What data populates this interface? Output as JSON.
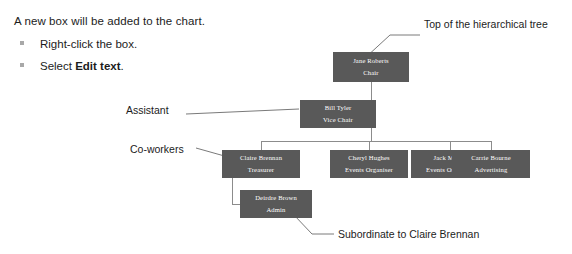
{
  "instructions": {
    "intro": "A new box will be added to the chart.",
    "bullets": [
      {
        "text_before": "Right-click the box.",
        "bold": "",
        "text_after": ""
      },
      {
        "text_before": "Select ",
        "bold": "Edit text",
        "text_after": "."
      }
    ]
  },
  "chart": {
    "type": "org-chart",
    "box_fill_color": "#595959",
    "box_text_color": "#ffffff",
    "connector_color": "#8c8c8c",
    "nodes": [
      {
        "id": "chair",
        "name": "Jane Roberts",
        "role": "Chair",
        "level": 0,
        "x": 333,
        "y": 52,
        "w": 76,
        "h": 30
      },
      {
        "id": "vice-chair",
        "name": "Bill Tyler",
        "role": "Vice Chair",
        "level": 1,
        "x": 300,
        "y": 100,
        "w": 76,
        "h": 28
      },
      {
        "id": "treasurer",
        "name": "Claire Brennan",
        "role": "Treasurer",
        "level": 2,
        "x": 222,
        "y": 150,
        "w": 78,
        "h": 28
      },
      {
        "id": "events-1",
        "name": "Cheryl Hughes",
        "role": "Events Organiser",
        "level": 2,
        "x": 330,
        "y": 150,
        "w": 78,
        "h": 28
      },
      {
        "id": "events-2",
        "name": "Jack Mason",
        "role": "Events Organiser",
        "level": 2,
        "x": 411,
        "y": 150,
        "w": 78,
        "h": 28
      },
      {
        "id": "advertising",
        "name": "Carrie Bourne",
        "role": "Advertising",
        "level": 2,
        "x": 452,
        "y": 150,
        "w": 78,
        "h": 28
      },
      {
        "id": "admin",
        "name": "Deirdre Brown",
        "role": "Admin",
        "level": 3,
        "x": 240,
        "y": 190,
        "w": 72,
        "h": 28
      }
    ],
    "callouts": [
      {
        "id": "top-of-tree",
        "label": "Top of the hierarchical tree",
        "x": 424,
        "y": 18,
        "target": "chair"
      },
      {
        "id": "assistant",
        "label": "Assistant",
        "x": 126,
        "y": 104,
        "target": "vice-chair"
      },
      {
        "id": "co-workers",
        "label": "Co-workers",
        "x": 130,
        "y": 143,
        "target": "treasurer"
      },
      {
        "id": "subordinate",
        "label": "Subordinate to Claire Brennan",
        "x": 338,
        "y": 228,
        "target": "admin"
      }
    ]
  }
}
